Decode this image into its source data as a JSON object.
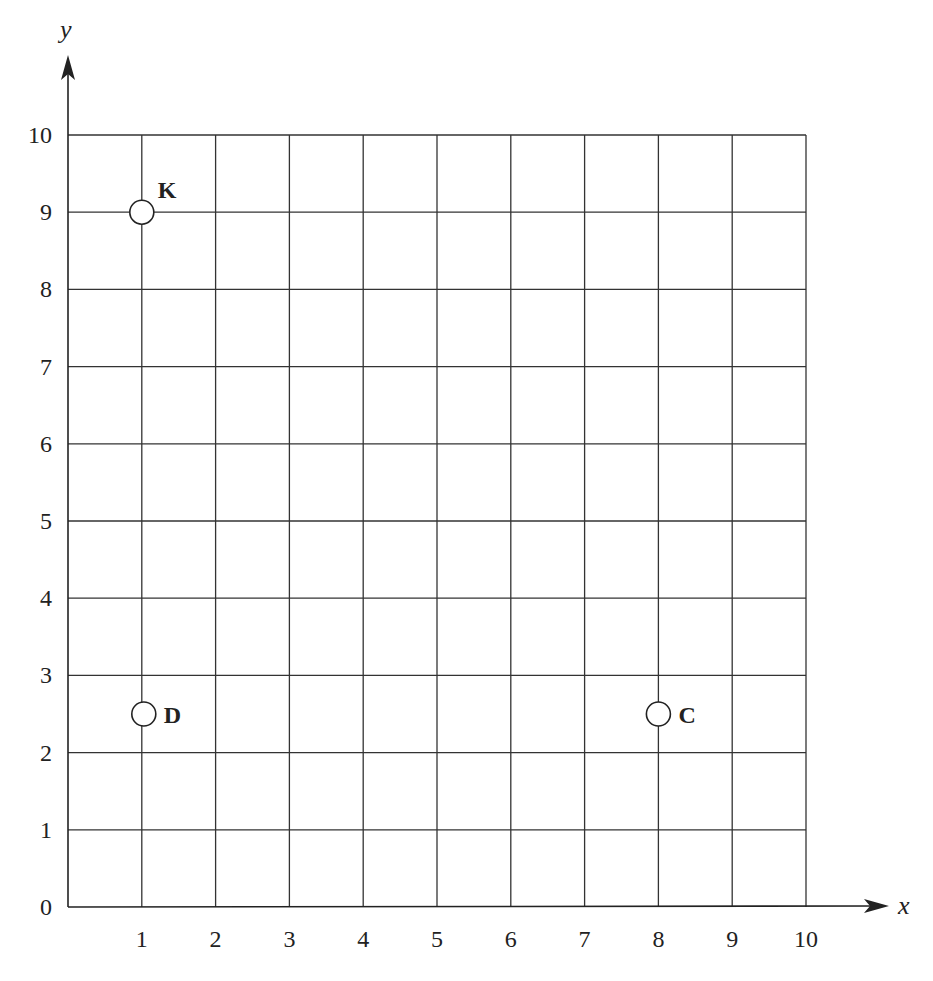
{
  "chart_data": {
    "type": "scatter",
    "title": "",
    "xlabel": "x",
    "ylabel": "y",
    "xlim": [
      0,
      10
    ],
    "ylim": [
      0,
      10
    ],
    "grid": true,
    "x_ticks": [
      "1",
      "2",
      "3",
      "4",
      "5",
      "6",
      "7",
      "8",
      "9",
      "10"
    ],
    "y_ticks": [
      "0",
      "1",
      "2",
      "3",
      "4",
      "5",
      "6",
      "7",
      "8",
      "9",
      "10"
    ],
    "points": [
      {
        "label": "K",
        "x": 1,
        "y": 9
      },
      {
        "label": "D",
        "x": 1,
        "y": 2.5
      },
      {
        "label": "C",
        "x": 8,
        "y": 2.5
      }
    ],
    "marker": "open-circle"
  }
}
